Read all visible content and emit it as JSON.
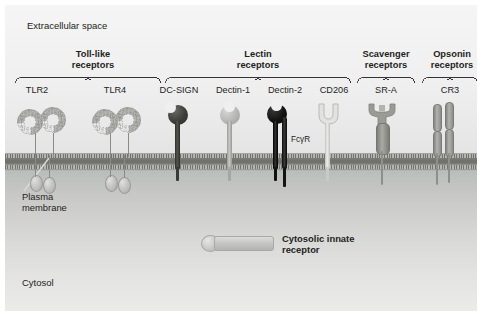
{
  "figure": {
    "zones": {
      "extracellular_label": "Extracellular space",
      "membrane_label_line1": "Plasma",
      "membrane_label_line2": "membrane",
      "cytosol_label": "Cytosol"
    },
    "groups": [
      {
        "id": "toll-like",
        "title_line1": "Toll-like",
        "title_line2": "receptors"
      },
      {
        "id": "lectin",
        "title_line1": "Lectin",
        "title_line2": "receptors"
      },
      {
        "id": "scavenger",
        "title_line1": "Scavenger",
        "title_line2": "receptors"
      },
      {
        "id": "opsonin",
        "title_line1": "Opsonin",
        "title_line2": "receptors"
      }
    ],
    "receptors": [
      {
        "id": "tlr2",
        "label": "TLR2",
        "group": "toll-like",
        "color": "#b4b5b1"
      },
      {
        "id": "tlr4",
        "label": "TLR4",
        "group": "toll-like",
        "color": "#b4b5b1"
      },
      {
        "id": "dc-sign",
        "label": "DC-SIGN",
        "group": "lectin",
        "color": "#4a4b47"
      },
      {
        "id": "dectin-1",
        "label": "Dectin-1",
        "group": "lectin",
        "color": "#b6b7b3"
      },
      {
        "id": "dectin-2",
        "label": "Dectin-2",
        "group": "lectin",
        "color": "#151515"
      },
      {
        "id": "cd206",
        "label": "CD206",
        "group": "lectin",
        "color": "#dcddda"
      },
      {
        "id": "sr-a",
        "label": "SR-A",
        "group": "scavenger",
        "color": "#93948f"
      },
      {
        "id": "cr3",
        "label": "CR3",
        "group": "opsonin",
        "color": "#9b9c98"
      }
    ],
    "inline_annotations": [
      {
        "id": "fcgr",
        "label": "FcγR"
      }
    ],
    "callouts": [
      {
        "id": "cytosolic-innate-receptor",
        "line1": "Cytosolic innate",
        "line2": "receptor"
      }
    ]
  }
}
